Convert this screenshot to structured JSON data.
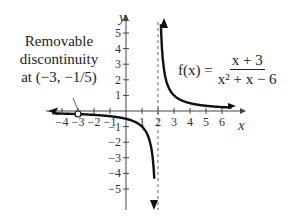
{
  "chart_data": {
    "type": "line",
    "title": "",
    "function_label": "f(x) = (x + 3)/(x^2 + x - 6)",
    "function_lhs": "f(x) =",
    "function_num": "x + 3",
    "function_den": "x² + x − 6",
    "xlabel": "x",
    "ylabel": "y",
    "xlim": [
      -4.5,
      6.8
    ],
    "ylim": [
      -5.8,
      6
    ],
    "x_ticks": [
      -4,
      -3,
      -2,
      -1,
      1,
      2,
      3,
      4,
      5,
      6
    ],
    "y_ticks": [
      -5,
      -4,
      -3,
      -2,
      -1,
      1,
      2,
      3,
      4,
      5
    ],
    "vertical_asymptote": 2,
    "horizontal_asymptote": 0,
    "removable_discontinuity": {
      "x": -3,
      "y": -0.2
    },
    "annotation": {
      "line1": "Removable",
      "line2": "discontinuity",
      "line3": "at (−3, −1/5)"
    },
    "series": [
      {
        "name": "left branch",
        "x": [
          -4.5,
          -3,
          -2,
          -1,
          0,
          1,
          1.5,
          1.8,
          1.9
        ],
        "y": [
          -0.08,
          -0.2,
          -0.25,
          -0.33,
          -0.5,
          -1,
          -2,
          -5,
          -10
        ]
      },
      {
        "name": "right branch",
        "x": [
          2.1,
          2.2,
          2.5,
          3,
          4,
          5,
          6.5
        ],
        "y": [
          10,
          5,
          2,
          1,
          0.5,
          0.33,
          0.22
        ]
      }
    ],
    "grid": false,
    "legend": "none"
  }
}
